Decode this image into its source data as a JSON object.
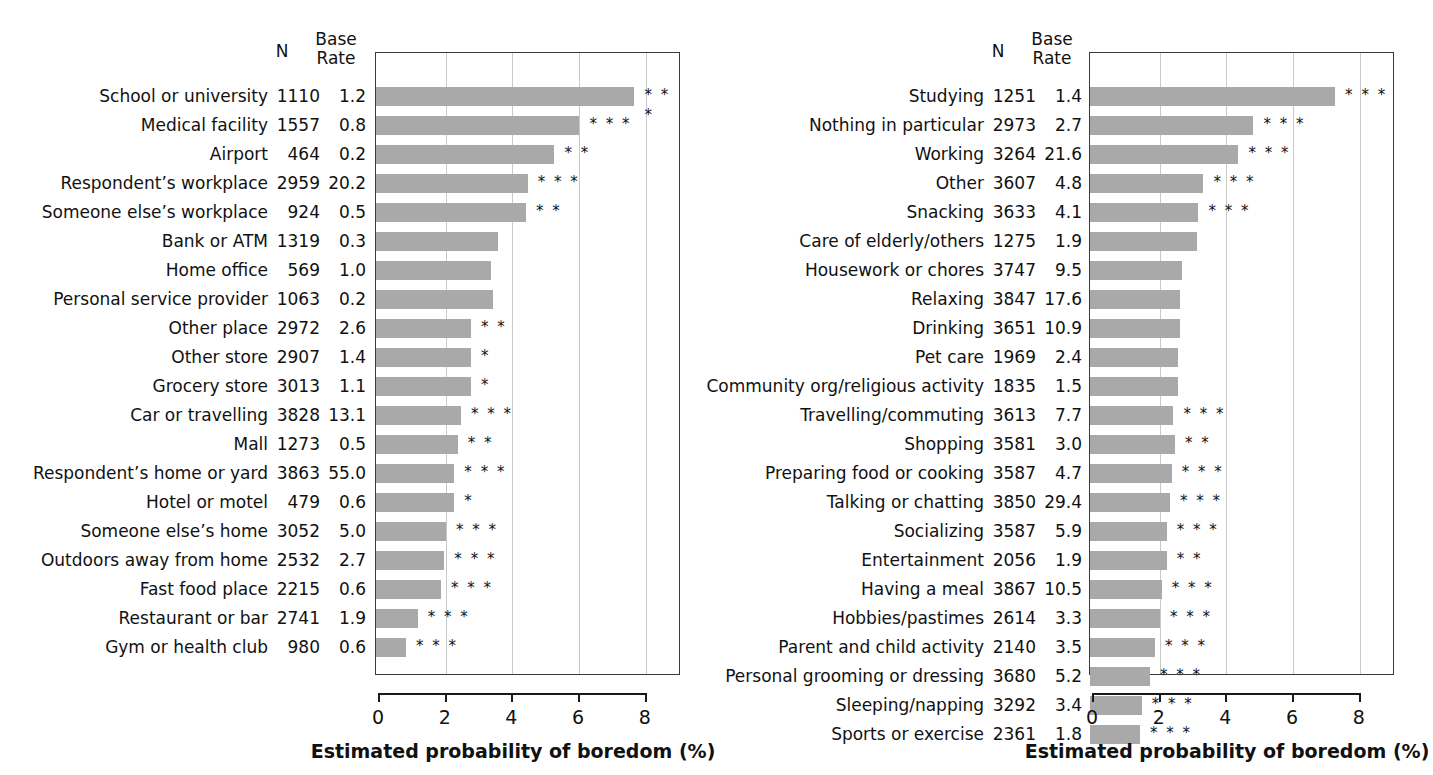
{
  "chart_data": [
    {
      "type": "bar",
      "panel": "left",
      "title": "",
      "xlabel": "Estimated probability of boredom (%)",
      "ylabel": "",
      "xlim": [
        0,
        9.1
      ],
      "xticks": [
        0,
        2,
        4,
        6,
        8
      ],
      "xticklabels": [
        "0",
        "2",
        "4",
        "6",
        "8"
      ],
      "grid": "vertical",
      "orientation": "horizontal",
      "columns": [
        "N",
        "Base Rate"
      ],
      "col_header_n": "N",
      "col_header_base": "Base\nRate",
      "col_header_base_l1": "Base",
      "col_header_base_l2": "Rate",
      "categories": [
        "School or university",
        "Medical facility",
        "Airport",
        "Respondent’s workplace",
        "Someone else’s workplace",
        "Bank or ATM",
        "Home office",
        "Personal service provider",
        "Other place",
        "Other store",
        "Grocery store",
        "Car or travelling",
        "Mall",
        "Respondent’s home or yard",
        "Hotel or motel",
        "Someone else’s home",
        "Outdoors away from home",
        "Fast food place",
        "Restaurant or bar",
        "Gym or health club"
      ],
      "n": [
        "1110",
        "1557",
        "464",
        "2959",
        "924",
        "1319",
        "569",
        "1063",
        "2972",
        "2907",
        "3013",
        "3828",
        "1273",
        "3863",
        "479",
        "3052",
        "2532",
        "2215",
        "2741",
        "980"
      ],
      "base_rate": [
        "1.2",
        "0.8",
        "0.2",
        "20.2",
        "0.5",
        "0.3",
        "1.0",
        "0.2",
        "2.6",
        "1.4",
        "1.1",
        "13.1",
        "0.5",
        "55.0",
        "0.6",
        "5.0",
        "2.7",
        "0.6",
        "1.9",
        "0.6"
      ],
      "values": [
        7.75,
        6.1,
        5.35,
        4.55,
        4.5,
        3.65,
        3.45,
        3.5,
        2.85,
        2.85,
        2.85,
        2.55,
        2.45,
        2.35,
        2.35,
        2.1,
        2.05,
        1.95,
        1.25,
        0.9
      ],
      "significance": [
        "***",
        "***",
        "**",
        "***",
        "**",
        "",
        "",
        "",
        "**",
        "*",
        "*",
        "***",
        "**",
        "***",
        "*",
        "***",
        "***",
        "***",
        "***",
        "***"
      ]
    },
    {
      "type": "bar",
      "panel": "right",
      "title": "",
      "xlabel": "Estimated probability of boredom (%)",
      "ylabel": "",
      "xlim": [
        0,
        9.1
      ],
      "xticks": [
        0,
        2,
        4,
        6,
        8
      ],
      "xticklabels": [
        "0",
        "2",
        "4",
        "6",
        "8"
      ],
      "grid": "vertical",
      "orientation": "horizontal",
      "columns": [
        "N",
        "Base Rate"
      ],
      "col_header_n": "N",
      "col_header_base_l1": "Base",
      "col_header_base_l2": "Rate",
      "categories": [
        "Studying",
        "Nothing in particular",
        "Working",
        "Other",
        "Snacking",
        "Care of elderly/others",
        "Housework or chores",
        "Relaxing",
        "Drinking",
        "Pet care",
        "Community org/religious activity",
        "Travelling/commuting",
        "Shopping",
        "Preparing food or cooking",
        "Talking or chatting",
        "Socializing",
        "Entertainment",
        "Having a meal",
        "Hobbies/pastimes",
        "Parent and child activity",
        "Personal grooming or dressing",
        "Sleeping/napping",
        "Sports or exercise"
      ],
      "n": [
        "1251",
        "2973",
        "3264",
        "3607",
        "3633",
        "1275",
        "3747",
        "3847",
        "3651",
        "1969",
        "1835",
        "3613",
        "3581",
        "3587",
        "3850",
        "3587",
        "2056",
        "3867",
        "2614",
        "2140",
        "3680",
        "3292",
        "2361"
      ],
      "base_rate": [
        "1.4",
        "2.7",
        "21.6",
        "4.8",
        "4.1",
        "1.9",
        "9.5",
        "17.6",
        "10.9",
        "2.4",
        "1.5",
        "7.7",
        "3.0",
        "4.7",
        "29.4",
        "5.9",
        "1.9",
        "10.5",
        "3.3",
        "3.5",
        "5.2",
        "3.4",
        "1.8"
      ],
      "values": [
        7.35,
        4.9,
        4.45,
        3.4,
        3.25,
        3.2,
        2.75,
        2.7,
        2.7,
        2.65,
        2.65,
        2.5,
        2.55,
        2.45,
        2.4,
        2.3,
        2.3,
        2.15,
        2.1,
        1.95,
        1.8,
        1.55,
        1.5
      ],
      "significance": [
        "***",
        "***",
        "***",
        "***",
        "***",
        "",
        "",
        "",
        "",
        "",
        "",
        "***",
        "**",
        "***",
        "***",
        "***",
        "**",
        "***",
        "***",
        "***",
        "***",
        "***",
        "***"
      ]
    }
  ]
}
